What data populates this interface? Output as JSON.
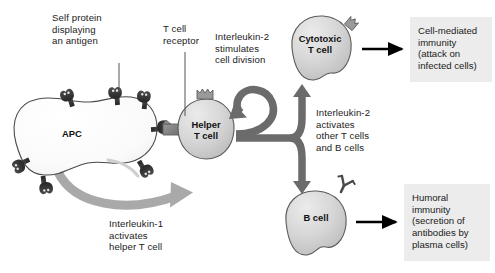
{
  "figure": {
    "background_color": "#ffffff",
    "colors": {
      "apc_fill": "#fbfbfb",
      "lymphocyte_fill": "#d2d2d2",
      "receptor_dark": "#3a3a3a",
      "mhc_dark": "#343434",
      "thick_arrow": "#6b6b6b",
      "interleukin1_arrow": "#aaaaaa",
      "black_arrow": "#000000",
      "outcome_box": "#ececec",
      "text": "#1b1b1b",
      "leader_line": "#555555"
    }
  },
  "labels": {
    "self_protein": "Self protein\ndisplaying\nan antigen",
    "t_cell_receptor": "T cell\nreceptor",
    "interleukin2_division": "Interleukin-2\nstimulates\ncell division",
    "interleukin2_activates": "Interleukin-2\nactivates\nother T cells\nand B cells",
    "interleukin1_activates": "Interleukin-1\nactivates\nhelper T cell"
  },
  "cells": [
    {
      "id": "apc",
      "label": "APC",
      "type": "antigen-presenting-cell"
    },
    {
      "id": "helper-t-cell",
      "label": "Helper\nT cell",
      "type": "lymphocyte"
    },
    {
      "id": "cytotoxic-t-cell",
      "label": "Cytotoxic\nT cell",
      "type": "lymphocyte"
    },
    {
      "id": "b-cell",
      "label": "B cell",
      "type": "lymphocyte"
    }
  ],
  "outcomes": [
    {
      "id": "cell-mediated",
      "text": "Cell-mediated\nimmunity\n(attack on\ninfected cells)"
    },
    {
      "id": "humoral",
      "text": "Humoral\nimmunity\n(secretion of\nantibodies by\nplasma cells)"
    }
  ],
  "icons": {
    "mhc": "mhc-antigen-icon",
    "tcr": "t-cell-receptor-icon",
    "antibody": "antibody-receptor-icon"
  }
}
